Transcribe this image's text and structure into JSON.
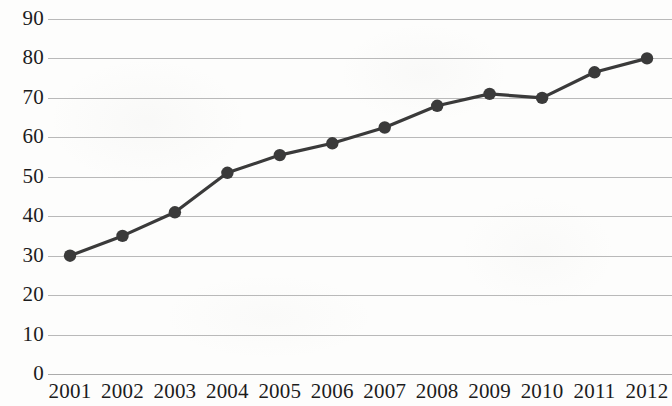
{
  "chart_data": {
    "type": "line",
    "title": "",
    "subtitle": "",
    "xlabel": "",
    "ylabel": "",
    "categories": [
      "2001",
      "2002",
      "2003",
      "2004",
      "2005",
      "2006",
      "2007",
      "2008",
      "2009",
      "2010",
      "2011",
      "2012"
    ],
    "values": [
      30,
      35,
      41,
      51,
      55.5,
      58.5,
      62.5,
      68,
      71,
      70,
      76.5,
      80
    ],
    "series": [
      {
        "name": "",
        "values": [
          30,
          35,
          41,
          51,
          55.5,
          58.5,
          62.5,
          68,
          71,
          70,
          76.5,
          80
        ]
      }
    ],
    "ylim": [
      0,
      90
    ],
    "y_ticks": [
      0,
      10,
      20,
      30,
      40,
      50,
      60,
      70,
      80,
      90
    ],
    "y_tick_labels": [
      "0",
      "10",
      "20",
      "30",
      "40",
      "50",
      "60",
      "70",
      "80",
      "90"
    ],
    "x_tick_labels": [
      "2001",
      "2002",
      "2003",
      "2004",
      "2005",
      "2006",
      "2007",
      "2008",
      "2009",
      "2010",
      "2011",
      "2012"
    ],
    "grid": "horizontal",
    "legend": "none",
    "marker": "circle",
    "colors": {
      "line": "#3a3a3a",
      "marker": "#3a3a3a",
      "gridline": "#b9b9b9",
      "baseline": "#ababab",
      "text": "#1c1c1c",
      "background": "#fdfdfc"
    },
    "annotations": []
  }
}
